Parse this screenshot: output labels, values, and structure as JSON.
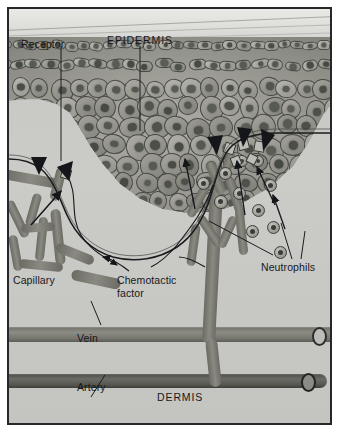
{
  "figure": {
    "background_color": "#c9c9c6",
    "frame_color": "#25282b"
  },
  "labels": {
    "receptor": "Receptor",
    "epidermis": "EPIDERMIS",
    "capillary": "Capillary",
    "chemotactic_factor": "Chemotactic\nfactor",
    "neutrophils": "Neutrophils",
    "vein": "Vein",
    "artery": "Artery",
    "dermis": "DERMIS"
  },
  "structures": {
    "epidermis_layer": "epidermis-cell-layer",
    "stratum_corneum": "stratum-corneum",
    "basement_membrane": "basement-membrane",
    "capillary_loop_left": "capillary-network-left",
    "capillary_loop_right": "capillary-network-right",
    "vein_vessel": "vein-vessel",
    "artery_vessel": "artery-vessel",
    "neutrophil_cells": "neutrophil-cells",
    "receptor_cells": "receptor-cells"
  },
  "colors": {
    "epidermis": "#9a9a92",
    "dermis": "#c6c6c3",
    "corneum": "#e1e1de",
    "vein": "#7c7c75",
    "artery": "#50514c",
    "outline": "#2e3030",
    "text": "#17181a"
  }
}
